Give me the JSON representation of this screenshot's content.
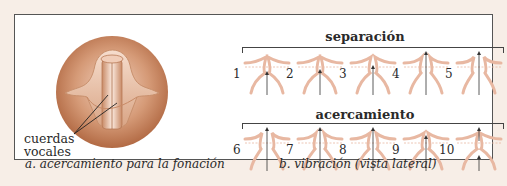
{
  "panel_a": {
    "label_line1": "cuerdas",
    "label_line2": "vocales",
    "caption": "a. acercamiento para la fonación"
  },
  "panel_b": {
    "heading_top": "separación",
    "heading_bottom": "acercamiento",
    "caption": "b. vibración (vista lateral)",
    "stages": [
      {
        "n": "1"
      },
      {
        "n": "2"
      },
      {
        "n": "3"
      },
      {
        "n": "4"
      },
      {
        "n": "5"
      },
      {
        "n": "6"
      },
      {
        "n": "7"
      },
      {
        "n": "8"
      },
      {
        "n": "9"
      },
      {
        "n": "10"
      }
    ]
  },
  "colors": {
    "tissue": "#e8b8a2",
    "tissue_dark": "#b06a45",
    "frame_bg": "#f7eee7"
  }
}
